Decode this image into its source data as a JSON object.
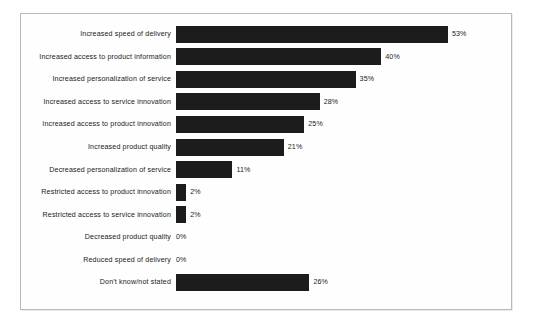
{
  "chart_data": {
    "type": "bar",
    "orientation": "horizontal",
    "title": "",
    "subtitle": "",
    "xlabel": "",
    "ylabel": "",
    "xlim": [
      0,
      60
    ],
    "grid": false,
    "legend": false,
    "value_suffix": "%",
    "categories": [
      "Increased speed of delivery",
      "Increased access to product information",
      "Increased personalization of service",
      "Increased access to service innovation",
      "Increased access to product innovation",
      "Increased product quality",
      "Decreased personalization of service",
      "Restricted access to product innovation",
      "Restricted access to service innovation",
      "Decreased product quality",
      "Reduced speed of delivery",
      "Don't know/not stated"
    ],
    "values": [
      53,
      40,
      35,
      28,
      25,
      21,
      11,
      2,
      2,
      0,
      0,
      26
    ],
    "value_labels": [
      "53%",
      "40%",
      "35%",
      "28%",
      "25%",
      "21%",
      "11%",
      "2%",
      "2%",
      "0%",
      "0%",
      "26%"
    ],
    "bar_color": "#1c1c1c",
    "background_color": "#ffffff",
    "border_color": "#b9b9b9"
  }
}
